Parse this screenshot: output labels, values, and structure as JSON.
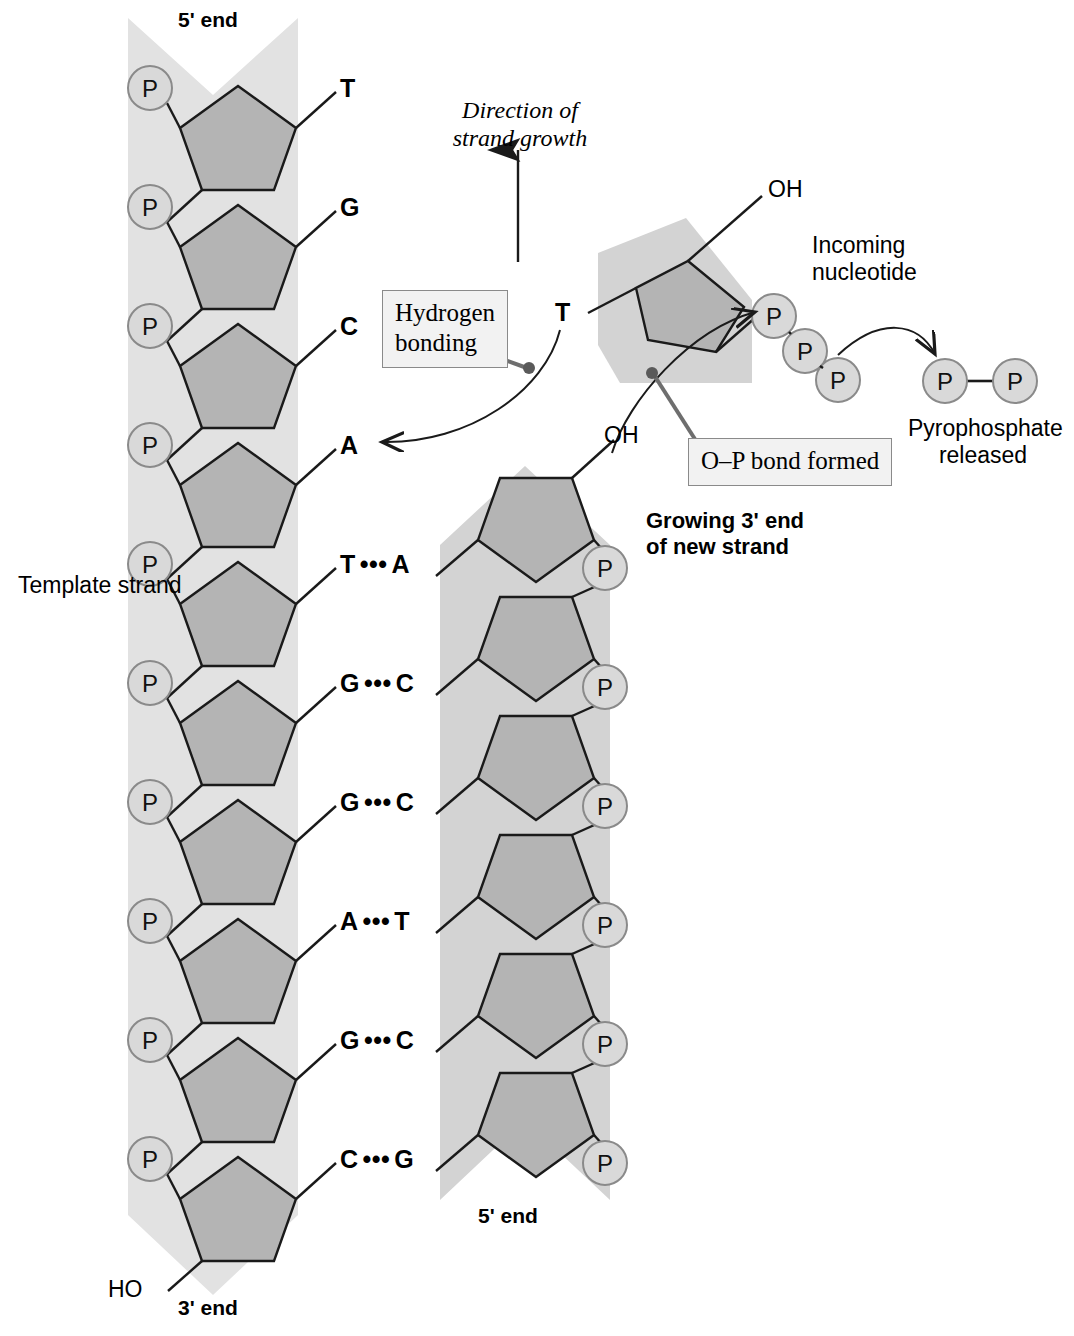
{
  "diagram": {
    "colors": {
      "backbone_band": "#e2e2e2",
      "sugar_fill": "#b4b4b4",
      "phosphate_fill": "#d9d9d9",
      "outline": "#1a1a1a",
      "callout_fill": "#f2f2f2",
      "callout_border": "#8a8a8a",
      "pointer_line": "#6e6e6e",
      "text": "#000000"
    }
  },
  "template_strand": {
    "label": "Template strand",
    "top_end_label": "5' end",
    "bottom_end_label": "3' end",
    "terminal_hydroxyl": "HO",
    "phosphate_symbol": "P",
    "phosphate_count": 10,
    "bases": [
      "T",
      "G",
      "C",
      "A",
      "T",
      "G",
      "G",
      "A",
      "G",
      "C"
    ]
  },
  "new_strand": {
    "label_line1": "Growing 3' end",
    "label_line2": "of new strand",
    "bottom_end_label": "5' end",
    "terminal_hydroxyl": "OH",
    "phosphate_symbol": "P",
    "phosphate_count": 6,
    "bases": [
      "A",
      "C",
      "C",
      "T",
      "C",
      "G"
    ]
  },
  "base_pairs": [
    {
      "template": "T",
      "new": "A",
      "bond": "•••"
    },
    {
      "template": "G",
      "new": "C",
      "bond": "•••"
    },
    {
      "template": "G",
      "new": "C",
      "bond": "•••"
    },
    {
      "template": "A",
      "new": "T",
      "bond": "•••"
    },
    {
      "template": "G",
      "new": "C",
      "bond": "•••"
    },
    {
      "template": "C",
      "new": "G",
      "bond": "•••"
    }
  ],
  "unpaired_template_bases": [
    "T",
    "G",
    "C",
    "A"
  ],
  "incoming_nucleotide": {
    "label_line1": "Incoming",
    "label_line2": "nucleotide",
    "base": "T",
    "hydroxyl": "OH",
    "phosphate_symbol": "P",
    "phosphate_count": 3
  },
  "pyrophosphate": {
    "label_line1": "Pyrophosphate",
    "label_line2": "released",
    "phosphate_symbol": "P",
    "phosphate_count": 2
  },
  "annotations": {
    "direction_line1": "Direction of",
    "direction_line2": "strand growth",
    "hydrogen_bonding_line1": "Hydrogen",
    "hydrogen_bonding_line2": "bonding",
    "op_bond": "O–P bond formed"
  }
}
